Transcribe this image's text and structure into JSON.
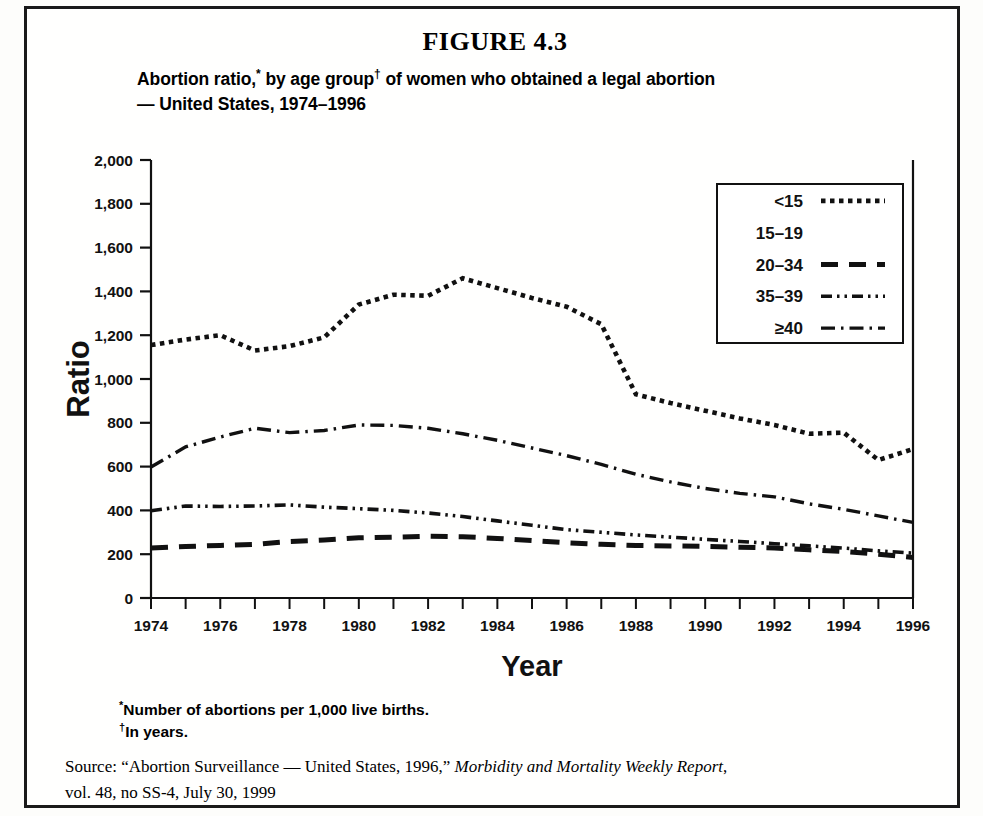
{
  "figure": {
    "number_label": "FIGURE 4.3",
    "title_line1_a": "Abortion ratio,",
    "title_line1_sup1": "*",
    "title_line1_b": " by age group",
    "title_line1_sup2": "†",
    "title_line1_c": " of women who obtained a legal abortion",
    "title_line2": "— United States, 1974–1996"
  },
  "footnotes": {
    "marker1": "*",
    "note1": "Number of abortions per 1,000 live births.",
    "marker2": "†",
    "note2": "In years."
  },
  "source": {
    "prefix": "Source: “Abortion Surveillance — United States, 1996,” ",
    "italic": "Morbidity and Mortality Weekly Report",
    "suffix": ",",
    "line2": "vol. 48, no SS-4, July 30, 1999"
  },
  "chart_data": {
    "type": "line",
    "title": "Abortion ratio,* by age group† of women who obtained a legal abortion — United States, 1974–1996",
    "xlabel": "Year",
    "ylabel": "Ratio",
    "xlim": [
      1974,
      1996
    ],
    "ylim": [
      0,
      2000
    ],
    "ytick_step": 200,
    "xtick_step": 1,
    "xtick_label_step": 2,
    "grid": false,
    "legend_position": "top-right",
    "ytick_labels": [
      "0",
      "200",
      "400",
      "600",
      "800",
      "1,000",
      "1,200",
      "1,400",
      "1,600",
      "1,800",
      "2,000"
    ],
    "xtick_labels": [
      "1974",
      "1976",
      "1978",
      "1980",
      "1982",
      "1984",
      "1986",
      "1988",
      "1990",
      "1992",
      "1994",
      "1996"
    ],
    "x": [
      1974,
      1975,
      1976,
      1977,
      1978,
      1979,
      1980,
      1981,
      1982,
      1983,
      1984,
      1985,
      1986,
      1987,
      1988,
      1989,
      1990,
      1991,
      1992,
      1993,
      1994,
      1995,
      1996
    ],
    "series": [
      {
        "name": "<15",
        "style": "dotted",
        "color": "#111111",
        "values": [
          1155,
          1180,
          1200,
          1130,
          1150,
          1190,
          1340,
          1385,
          1380,
          1460,
          1415,
          1370,
          1330,
          1250,
          930,
          890,
          855,
          820,
          790,
          750,
          755,
          630,
          680
        ]
      },
      {
        "name": "15–19",
        "style": "solid",
        "color": "#111111",
        "values": [
          null,
          null,
          null,
          null,
          null,
          null,
          null,
          null,
          null,
          null,
          null,
          null,
          null,
          null,
          null,
          null,
          null,
          null,
          null,
          null,
          null,
          null,
          null
        ]
      },
      {
        "name": "20–34",
        "style": "dashed",
        "color": "#111111",
        "values": [
          228,
          235,
          240,
          245,
          258,
          265,
          275,
          278,
          282,
          280,
          272,
          262,
          252,
          245,
          240,
          238,
          236,
          232,
          228,
          220,
          212,
          200,
          185
        ]
      },
      {
        "name": "35–39",
        "style": "dash-dot-dot",
        "color": "#111111",
        "values": [
          398,
          420,
          418,
          420,
          425,
          415,
          408,
          400,
          388,
          372,
          352,
          332,
          312,
          300,
          288,
          278,
          268,
          258,
          248,
          238,
          228,
          215,
          205
        ]
      },
      {
        "name": "≥40",
        "style": "dash-dot",
        "color": "#111111",
        "values": [
          598,
          690,
          735,
          775,
          755,
          765,
          790,
          788,
          775,
          750,
          720,
          685,
          650,
          610,
          565,
          530,
          500,
          478,
          462,
          430,
          405,
          375,
          345
        ]
      }
    ]
  },
  "legend": {
    "entries": [
      {
        "label": "<15",
        "style": "dotted"
      },
      {
        "label": "15–19",
        "style": "solid"
      },
      {
        "label": "20–34",
        "style": "dashed"
      },
      {
        "label": "35–39",
        "style": "dash-dot-dot"
      },
      {
        "label": "≥40",
        "style": "dash-dot"
      }
    ]
  }
}
